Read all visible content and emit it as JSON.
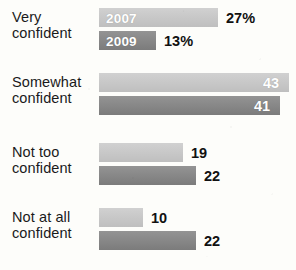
{
  "chart_data": {
    "type": "bar",
    "title": "",
    "subtitle": "",
    "xlabel": "",
    "ylabel": "",
    "orientation": "horizontal",
    "grid": false,
    "legend_position": "in-bar",
    "categories": [
      "Very confident",
      "Somewhat confident",
      "Not too confident",
      "Not at all confident"
    ],
    "category_lines": [
      [
        "Very",
        "confident"
      ],
      [
        "Somewhat",
        "confident"
      ],
      [
        "Not too",
        "confident"
      ],
      [
        "Not at all",
        "confident"
      ]
    ],
    "series": [
      {
        "name": "2007",
        "color": "#c9c9c9",
        "values": [
          27,
          43,
          19,
          10
        ],
        "labels": [
          "27%",
          "43",
          "19",
          "10"
        ]
      },
      {
        "name": "2009",
        "color": "#828282",
        "values": [
          13,
          41,
          22,
          22
        ],
        "labels": [
          "13%",
          "41",
          "22",
          "22"
        ]
      }
    ],
    "xlim": [
      0,
      43
    ]
  },
  "legend": {
    "series_2007_tag": "2007",
    "series_2009_tag": "2009"
  },
  "groups": [
    {
      "label_line1": "Very",
      "label_line2": "confident",
      "bars": [
        {
          "series": "2007",
          "value_label": "27%",
          "inside_tag": "2007",
          "label_inside": false
        },
        {
          "series": "2009",
          "value_label": "13%",
          "inside_tag": "2009",
          "label_inside": false
        }
      ]
    },
    {
      "label_line1": "Somewhat",
      "label_line2": "confident",
      "bars": [
        {
          "series": "2007",
          "value_label": "43",
          "inside_tag": "",
          "label_inside": true
        },
        {
          "series": "2009",
          "value_label": "41",
          "inside_tag": "",
          "label_inside": true
        }
      ]
    },
    {
      "label_line1": "Not too",
      "label_line2": "confident",
      "bars": [
        {
          "series": "2007",
          "value_label": "19",
          "inside_tag": "",
          "label_inside": false
        },
        {
          "series": "2009",
          "value_label": "22",
          "inside_tag": "",
          "label_inside": false
        }
      ]
    },
    {
      "label_line1": "Not at all",
      "label_line2": "confident",
      "bars": [
        {
          "series": "2007",
          "value_label": "10",
          "inside_tag": "",
          "label_inside": false
        },
        {
          "series": "2009",
          "value_label": "22",
          "inside_tag": "",
          "label_inside": false
        }
      ]
    }
  ],
  "colors": {
    "series_2007": "#c9c9c9",
    "series_2009": "#828282",
    "text": "#1a1a1a",
    "background": "#fdfdfa"
  }
}
